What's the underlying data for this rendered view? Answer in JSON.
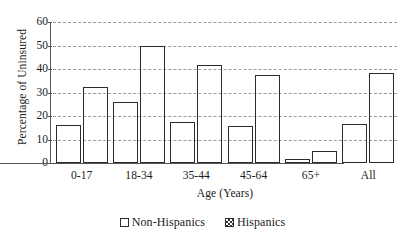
{
  "chart_data": {
    "type": "bar",
    "title": "",
    "xlabel": "Age (Years)",
    "ylabel": "Percentage of Uninsured",
    "categories": [
      "0-17",
      "18-34",
      "35-44",
      "45-64",
      "65+",
      "All"
    ],
    "series": [
      {
        "name": "Non-Hispanics",
        "pattern": "dotted",
        "values": [
          16.0,
          26.0,
          17.5,
          15.8,
          1.5,
          16.8
        ]
      },
      {
        "name": "Hispanics",
        "pattern": "checkerboard",
        "values": [
          32.2,
          50.0,
          41.6,
          37.4,
          5.3,
          38.2
        ]
      }
    ],
    "ylim": [
      0,
      60
    ],
    "ytick_values": [
      60,
      50,
      40,
      30,
      20,
      10,
      0
    ],
    "ytick_labels": [
      "60",
      "50",
      "40",
      "30",
      "20",
      "10",
      "0"
    ],
    "grid": true,
    "grid_style": "dashed-horizontal",
    "legend_position": "bottom-center",
    "colors": {
      "bar_outline": "#2b2b2b",
      "gridline": "#9b9b9b",
      "axis": "#555555",
      "text": "#1a1a1a",
      "background": "#ffffff"
    }
  },
  "legend": {
    "items": [
      {
        "label": "Non-Hispanics"
      },
      {
        "label": "Hispanics"
      }
    ]
  }
}
